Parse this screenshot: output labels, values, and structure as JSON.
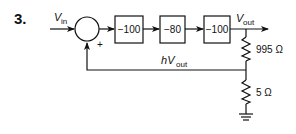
{
  "problem": {
    "number": "3."
  },
  "input": {
    "label_main": "V",
    "label_sub": "in"
  },
  "summer": {
    "sign_feedback": "+"
  },
  "blocks": [
    {
      "gain": "−100"
    },
    {
      "gain": "−80"
    },
    {
      "gain": "−100"
    }
  ],
  "output": {
    "label_main": "V",
    "label_sub": "out"
  },
  "feedback": {
    "label_prefix": "h",
    "label_main": "V",
    "label_sub": "out"
  },
  "resistors": [
    {
      "value": "995 Ω"
    },
    {
      "value": "5 Ω"
    }
  ],
  "colors": {
    "line": "#111111",
    "background": "#ffffff"
  }
}
